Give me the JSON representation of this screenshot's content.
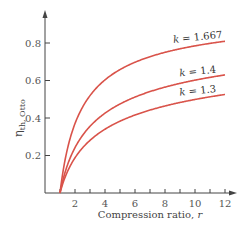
{
  "chart_data": {
    "type": "line",
    "title": "",
    "xlabel": "Compression ratio, r",
    "xlabel_text": "Compression ratio, ",
    "xlabel_var": "r",
    "ylabel": "η th, Otto",
    "ylabel_symbol": "η",
    "ylabel_subscript": "th, Otto",
    "xlim": [
      0,
      12.5
    ],
    "ylim": [
      0,
      0.93
    ],
    "x_ticks": [
      1,
      2,
      3,
      4,
      5,
      6,
      7,
      8,
      9,
      10,
      11,
      12
    ],
    "x_tick_labels": [
      "2",
      "4",
      "6",
      "8",
      "10",
      "12"
    ],
    "x_tick_label_values": [
      2,
      4,
      6,
      8,
      10,
      12
    ],
    "y_ticks": [
      0.2,
      0.4,
      0.6,
      0.8
    ],
    "y_tick_labels": [
      "0.2",
      "0.4",
      "0.6",
      "0.8"
    ],
    "grid": false,
    "legend": "inline labels near right end of curves",
    "formula": "eta = 1 - 1 / r^(k-1)",
    "x": [
      1,
      2,
      3,
      4,
      5,
      6,
      7,
      8,
      9,
      10,
      11,
      12
    ],
    "series": [
      {
        "name": "k = 1.667",
        "k": 1.667,
        "label": "k = 1.667",
        "label_var": "k",
        "label_val": " = 1.667",
        "values": [
          0.0,
          0.371,
          0.519,
          0.604,
          0.658,
          0.697,
          0.726,
          0.749,
          0.769,
          0.785,
          0.798,
          0.809
        ]
      },
      {
        "name": "k = 1.4",
        "k": 1.4,
        "label": "k = 1.4",
        "label_var": "k",
        "label_val": " = 1.4",
        "values": [
          0.0,
          0.242,
          0.356,
          0.426,
          0.475,
          0.512,
          0.541,
          0.565,
          0.585,
          0.602,
          0.617,
          0.63
        ]
      },
      {
        "name": "k = 1.3",
        "k": 1.3,
        "label": "k = 1.3",
        "label_var": "k",
        "label_val": " = 1.3",
        "values": [
          0.0,
          0.188,
          0.281,
          0.34,
          0.383,
          0.416,
          0.442,
          0.464,
          0.483,
          0.499,
          0.513,
          0.526
        ]
      }
    ],
    "colors": {
      "curve": "#d9534a",
      "axis": "#444444",
      "text": "#555555"
    }
  }
}
